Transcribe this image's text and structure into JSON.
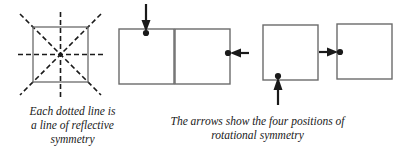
{
  "page": {
    "width": 399,
    "height": 160,
    "background": "#ffffff",
    "ink_color": "#1a1a1a",
    "square_stroke": "#555555"
  },
  "reflective": {
    "figure_name": "square-with-lines-of-symmetry",
    "square": {
      "x": 33,
      "y": 28,
      "size": 55
    },
    "overhang": 13,
    "dash_pattern": "5,3",
    "lines": [
      {
        "name": "vertical-line-of-symmetry",
        "orientation": "vertical"
      },
      {
        "name": "horizontal-line-of-symmetry",
        "orientation": "horizontal"
      },
      {
        "name": "diagonal-line-of-symmetry-tlbr",
        "orientation": "diagonal-down"
      },
      {
        "name": "diagonal-line-of-symmetry-trbl",
        "orientation": "diagonal-up"
      }
    ],
    "center_dot": true,
    "caption": {
      "lines": [
        "Each dotted line is",
        "a line of reflective",
        "symmetry"
      ]
    }
  },
  "rotational": {
    "figure_name": "four-positions-of-rotational-symmetry",
    "square_size": 55,
    "squares": [
      {
        "name": "square-position-1",
        "x": 7,
        "y": 29,
        "dot": {
          "x": 34,
          "y": 33
        },
        "arrow": {
          "name": "arrow-down",
          "direction": "down",
          "from_x": 34,
          "from_y": 4,
          "to_x": 34,
          "to_y": 31
        }
      },
      {
        "name": "square-position-2",
        "x": 63,
        "y": 29,
        "dot": {
          "x": 116,
          "y": 53
        },
        "arrow": {
          "name": "arrow-left",
          "direction": "left",
          "from_x": 136,
          "from_y": 53,
          "to_x": 119,
          "to_y": 53
        }
      },
      {
        "name": "square-position-3",
        "x": 151,
        "y": 25,
        "dot": {
          "x": 166,
          "y": 76
        },
        "arrow": {
          "name": "arrow-up",
          "direction": "up",
          "from_x": 166,
          "from_y": 105,
          "to_x": 166,
          "to_y": 79
        }
      },
      {
        "name": "square-position-4",
        "x": 225,
        "y": 24,
        "dot": {
          "x": 228,
          "y": 52
        },
        "arrow": {
          "name": "arrow-right",
          "direction": "right",
          "from_x": 208,
          "from_y": 52,
          "to_x": 225,
          "to_y": 52
        }
      }
    ],
    "caption": {
      "lines": [
        "The arrows show the four positions of",
        "rotational symmetry"
      ]
    }
  }
}
